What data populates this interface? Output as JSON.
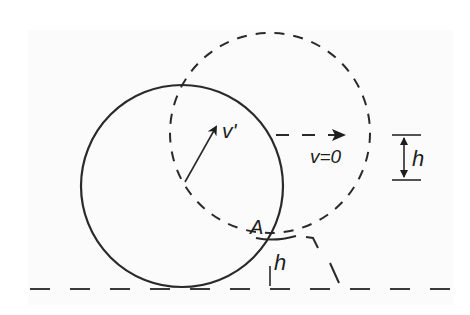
{
  "diagram": {
    "type": "physics-figure",
    "labels": {
      "velocity_after": "v'",
      "velocity_top": "v=0",
      "contact_point": "A",
      "step_height_left": "h",
      "step_height_right": "h"
    },
    "elements": {
      "ball_initial": {
        "cx": 182,
        "cy": 186,
        "r": 100,
        "style": "solid"
      },
      "ball_final": {
        "cx": 270,
        "cy": 133,
        "r": 100,
        "style": "dashed"
      },
      "ground_line_y": 289,
      "step_level_y": 238,
      "contact_point": {
        "x": 268,
        "y": 238
      }
    },
    "colors": {
      "stroke": "#2a2a2a",
      "background": "#ffffff"
    }
  }
}
